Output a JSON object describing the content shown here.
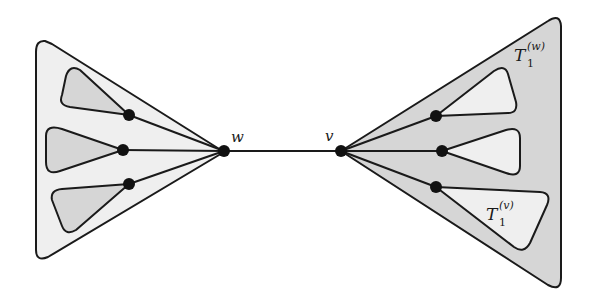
{
  "figure": {
    "colors": {
      "background": "#ffffff",
      "light_fill": "#efefef",
      "dark_fill": "#d6d6d6",
      "stroke": "#1a1a1a",
      "node": "#111111"
    }
  },
  "nodes": {
    "w": {
      "label": "w"
    },
    "v": {
      "label": "v"
    }
  },
  "labels": {
    "outer_right": {
      "base": "T",
      "sub": "1",
      "sup": "(w)"
    },
    "inner_right_bottom": {
      "base": "T",
      "sub": "1",
      "sup": "(v)"
    }
  }
}
